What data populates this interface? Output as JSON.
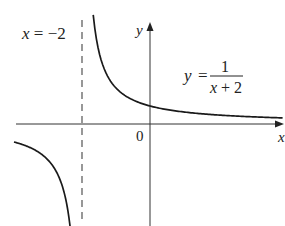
{
  "figure": {
    "asymptote_label": "x = −2",
    "asymptote_label_parts": {
      "var": "x",
      "eq": " = ",
      "val": "−2"
    },
    "y_axis_label": "y",
    "x_axis_label": "x",
    "origin_label": "0",
    "equation": {
      "lhs": "y",
      "eq": "=",
      "numerator": "1",
      "denominator": "x + 2"
    },
    "colors": {
      "curve": "#1a1a1a",
      "axis": "#333333",
      "asymptote": "#444444",
      "background": "#ffffff"
    }
  },
  "chart_data": {
    "type": "line",
    "title": "",
    "function": "y = 1/(x+2)",
    "vertical_asymptote": -2,
    "horizontal_asymptote": 0,
    "xlabel": "x",
    "ylabel": "y",
    "origin_tick": "0",
    "y_intercept": 0.5,
    "series": [
      {
        "name": "right branch",
        "x_range": [
          -1.67,
          3.9
        ]
      },
      {
        "name": "left branch",
        "x_range": [
          -4.0,
          -2.27
        ]
      }
    ],
    "grid": false
  }
}
